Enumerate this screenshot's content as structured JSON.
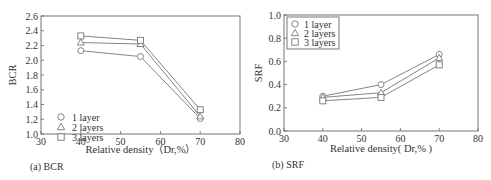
{
  "chart_data": [
    {
      "type": "line",
      "title": "",
      "caption": "(a) BCR",
      "xlabel": "Relative density（Dr,%）",
      "ylabel": "BCR",
      "xlim": [
        30,
        80
      ],
      "ylim": [
        1.0,
        2.6
      ],
      "xticks": [
        30,
        40,
        50,
        60,
        70,
        80
      ],
      "yticks": [
        1.0,
        1.2,
        1.4,
        1.6,
        1.8,
        2.0,
        2.2,
        2.4,
        2.6
      ],
      "ytick_labels": [
        "1.0",
        "1.2",
        "1.4",
        "1.6",
        "1.8",
        "2.0",
        "2.2",
        "2.4",
        "2.6"
      ],
      "x": [
        40,
        55,
        70
      ],
      "series": [
        {
          "name": "1 layer",
          "marker": "circle",
          "values": [
            2.13,
            2.05,
            1.21
          ]
        },
        {
          "name": "2 layers",
          "marker": "triangle",
          "values": [
            2.24,
            2.22,
            1.24
          ]
        },
        {
          "name": "3 layers",
          "marker": "square",
          "values": [
            2.33,
            2.27,
            1.33
          ]
        }
      ],
      "legend_position": "lower-left",
      "legend_box": false,
      "grid": false,
      "line_color": "#777777"
    },
    {
      "type": "line",
      "title": "",
      "caption": "(b) SRF",
      "xlabel": "Relative density( Dr,% )",
      "ylabel": "SRF",
      "xlim": [
        30,
        80
      ],
      "ylim": [
        0.0,
        1.0
      ],
      "xticks": [
        30,
        40,
        50,
        60,
        70,
        80
      ],
      "yticks": [
        0.0,
        0.2,
        0.4,
        0.6,
        0.8,
        1.0
      ],
      "ytick_labels": [
        "0.0",
        "0.2",
        "0.4",
        "0.6",
        "0.8",
        "1.0"
      ],
      "x": [
        40,
        55,
        70
      ],
      "series": [
        {
          "name": "1 layer",
          "marker": "circle",
          "values": [
            0.3,
            0.4,
            0.66
          ]
        },
        {
          "name": "2 layers",
          "marker": "triangle",
          "values": [
            0.29,
            0.33,
            0.63
          ]
        },
        {
          "name": "3 layers",
          "marker": "square",
          "values": [
            0.26,
            0.29,
            0.57
          ]
        }
      ],
      "legend_position": "upper-left",
      "legend_box": true,
      "grid": false,
      "line_color": "#777777"
    }
  ]
}
